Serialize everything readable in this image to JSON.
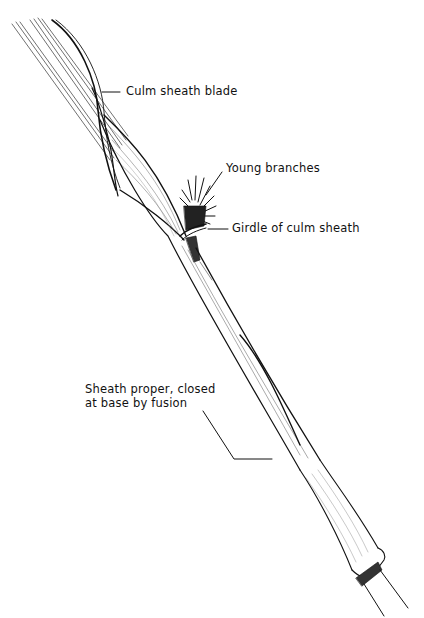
{
  "figure": {
    "background_color": "#ffffff",
    "ink_color": "#111111"
  },
  "labels": {
    "culm_sheath_blade": "Culm sheath blade",
    "young_branches": "Young branches",
    "girdle": "Girdle of culm sheath",
    "sheath_proper_line1": "Sheath proper, closed",
    "sheath_proper_line2": "at base by fusion"
  }
}
